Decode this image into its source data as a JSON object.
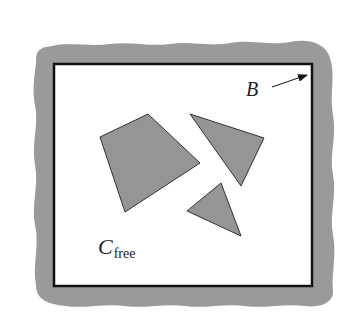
{
  "diagram": {
    "type": "configuration-space-illustration",
    "labels": {
      "boundary": "B",
      "free_space_main": "C",
      "free_space_sub": "free"
    },
    "colors": {
      "background": "#ffffff",
      "boundary_band": "#9a9a9a",
      "obstacle_fill": "#959595",
      "obstacle_stroke": "#333333",
      "frame_stroke": "#111111",
      "text": "#222222"
    },
    "frame": {
      "x": 54,
      "y": 64,
      "width": 258,
      "height": 222
    },
    "obstacles": [
      {
        "name": "quadrilateral",
        "points": "100,137 148,114 200,163 125,212"
      },
      {
        "name": "triangle-upper",
        "points": "190,114 264,138 241,186"
      },
      {
        "name": "triangle-lower",
        "points": "187,211 221,183 241,236"
      }
    ],
    "arrow": {
      "x1": 272,
      "y1": 87,
      "x2": 307,
      "y2": 75
    }
  }
}
